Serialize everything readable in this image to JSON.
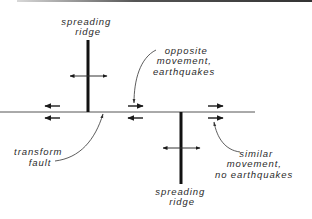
{
  "diagram": {
    "labels": {
      "ridge_top": [
        "spreading",
        "ridge"
      ],
      "opposite": [
        "opposite",
        "movement,",
        "earthquakes"
      ],
      "transform": [
        "transform",
        "fault"
      ],
      "similar": [
        "similar",
        "movement,",
        "no earthquakes"
      ],
      "ridge_bottom": [
        "spreading",
        "ridge"
      ]
    },
    "motion_arrows": {
      "upper_row": [
        "left",
        "right",
        "right"
      ],
      "lower_row": [
        "left",
        "left",
        "right"
      ]
    },
    "colors": {
      "ink": "#1a1a1a",
      "text": "#2a2a2a",
      "background": "#ffffff"
    }
  }
}
